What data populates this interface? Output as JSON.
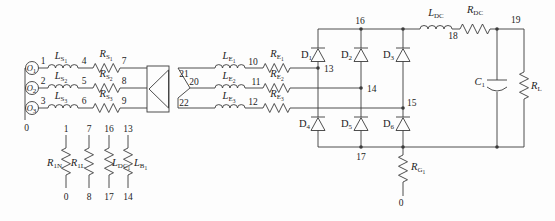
{
  "colors": {
    "stroke": "#3b3b3b",
    "text": "#1c1c1c",
    "background": "#fdfdfd"
  },
  "source_block": {
    "ground_node": "0",
    "phases": [
      {
        "source_base": "O",
        "source_sub": "1",
        "node_a": "1",
        "ind_base": "L",
        "ind_sub": "S",
        "ind_idx": "1",
        "node_b": "4",
        "res_base": "R",
        "res_sub": "S",
        "res_idx": "1",
        "node_c": "7"
      },
      {
        "source_base": "O",
        "source_sub": "2",
        "node_a": "2",
        "ind_base": "L",
        "ind_sub": "S",
        "ind_idx": "2",
        "node_b": "5",
        "res_base": "R",
        "res_sub": "S",
        "res_idx": "2",
        "node_c": "8"
      },
      {
        "source_base": "O",
        "source_sub": "3",
        "node_a": "3",
        "ind_base": "L",
        "ind_sub": "S",
        "ind_idx": "3",
        "node_b": "6",
        "res_base": "R",
        "res_sub": "S",
        "res_idx": "3",
        "node_c": "9"
      }
    ]
  },
  "transformer": {
    "sec_node_top": "21",
    "sec_node_mid": "20",
    "sec_node_bot": "22"
  },
  "secondary_block": {
    "phases": [
      {
        "ind_base": "L",
        "ind_sub": "E",
        "ind_idx": "1",
        "node": "10",
        "res_base": "R",
        "res_sub": "E",
        "res_idx": "1"
      },
      {
        "ind_base": "L",
        "ind_sub": "E",
        "ind_idx": "2",
        "node": "11",
        "res_base": "R",
        "res_sub": "E",
        "res_idx": "2"
      },
      {
        "ind_base": "L",
        "ind_sub": "E",
        "ind_idx": "3",
        "node": "12",
        "res_base": "R",
        "res_sub": "E",
        "res_idx": "3"
      }
    ]
  },
  "bridge": {
    "node_top": "16",
    "node_bottom": "17",
    "phase_nodes": [
      "13",
      "14",
      "15"
    ],
    "diodes_upper": [
      {
        "base": "D",
        "sub": "1"
      },
      {
        "base": "D",
        "sub": "2"
      },
      {
        "base": "D",
        "sub": "3"
      }
    ],
    "diodes_lower": [
      {
        "base": "D",
        "sub": "4"
      },
      {
        "base": "D",
        "sub": "5"
      },
      {
        "base": "D",
        "sub": "6"
      }
    ]
  },
  "dc_output": {
    "ind_base": "L",
    "ind_sub": "DC",
    "node_18": "18",
    "res_base": "R",
    "res_sub": "DC",
    "node_19": "19",
    "cap_base": "C",
    "cap_sub": "1",
    "load_base": "R",
    "load_sub": "L",
    "gnd_res_base": "R",
    "gnd_res_sub": "G",
    "gnd_res_idx": "1",
    "gnd_node": "0"
  },
  "shunt_block": {
    "columns": [
      {
        "node_top": "1",
        "node_bottom": "0",
        "label_base": "R",
        "label_sub": "1N",
        "label_idx": ""
      },
      {
        "node_top": "7",
        "node_bottom": "8",
        "label_base": "R",
        "label_sub": "1L",
        "label_idx": ""
      },
      {
        "node_top": "16",
        "node_bottom": "17",
        "label_base": "L",
        "label_sub": "DC",
        "label_idx": "1"
      },
      {
        "node_top": "13",
        "node_bottom": "14",
        "label_base": "L",
        "label_sub": "B",
        "label_idx": "1"
      }
    ]
  }
}
